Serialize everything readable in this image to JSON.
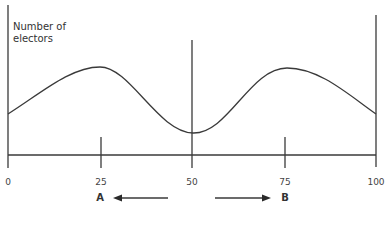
{
  "diagram": {
    "y_axis_label": "Number of electors",
    "y_axis_label_line1": "Number of",
    "y_axis_label_line2": "electors",
    "x_ticks": [
      {
        "label": "0",
        "value": 0
      },
      {
        "label": "25",
        "value": 25
      },
      {
        "label": "50",
        "value": 50
      },
      {
        "label": "75",
        "value": 75
      },
      {
        "label": "100",
        "value": 100
      }
    ],
    "positions": {
      "a": {
        "label": "A",
        "arrow_direction": "left"
      },
      "b": {
        "label": "B",
        "arrow_direction": "right"
      }
    },
    "curve": {
      "description": "Bimodal distribution of electors with peaks at 25 and 75 and a trough at 50",
      "peaks": [
        25,
        75
      ],
      "trough": 50
    },
    "colors": {
      "line": "#3a3a3a",
      "background": "#ffffff",
      "text": "#333333"
    }
  }
}
